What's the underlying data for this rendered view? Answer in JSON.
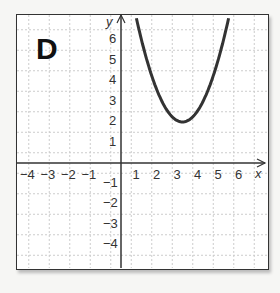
{
  "panel_label": "D",
  "chart_data": {
    "type": "line",
    "title": "",
    "function": "y = (x - 3)^2 + 2",
    "vertex": [
      3,
      2
    ],
    "xlabel": "x",
    "ylabel": "y",
    "xlim": [
      -5,
      6.5
    ],
    "ylim": [
      -5,
      7
    ],
    "x_ticks": [
      "-4",
      "-3",
      "-2",
      "-1",
      "1",
      "2",
      "3",
      "4",
      "5",
      "6"
    ],
    "y_ticks": [
      "6",
      "5",
      "4",
      "3",
      "2",
      "1",
      "-1",
      "-2",
      "-3",
      "-4"
    ],
    "grid": true,
    "series": [
      {
        "name": "parabola",
        "x": [
          0.7,
          1,
          2,
          3,
          4,
          5,
          5.3
        ],
        "y": [
          7.29,
          6,
          3,
          2,
          3,
          6,
          7.29
        ]
      }
    ]
  }
}
